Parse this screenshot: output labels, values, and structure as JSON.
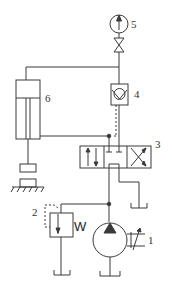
{
  "diagram": {
    "type": "hydraulic-circuit",
    "components": [
      {
        "id": "1",
        "name": "Pump (variable displacement with motor)",
        "label": "1"
      },
      {
        "id": "2",
        "name": "Relief valve",
        "label": "2",
        "marker": "W"
      },
      {
        "id": "3",
        "name": "Directional control valve (3-position)",
        "label": "3"
      },
      {
        "id": "4",
        "name": "Pilot-operated check valve",
        "label": "4"
      },
      {
        "id": "5",
        "name": "Pressure gauge",
        "label": "5"
      },
      {
        "id": "6",
        "name": "Hydraulic cylinder",
        "label": "6"
      }
    ],
    "colors": {
      "line": "#3a3a3a",
      "background": "#ffffff"
    }
  }
}
